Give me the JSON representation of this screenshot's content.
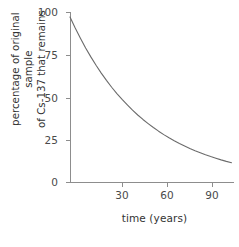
{
  "chart_data": {
    "type": "line",
    "title": "",
    "subtitle": "",
    "xlabel": "time (years)",
    "ylabel_line1": "percentage of original sample",
    "ylabel_line2": "of Cs-137 that remains",
    "ylabel": "percentage of original sample of Cs-137 that remains",
    "xlim": [
      0,
      95
    ],
    "ylim": [
      0,
      103
    ],
    "xticks": [
      30,
      60,
      90
    ],
    "xtick_labels": [
      "30",
      "60",
      "90"
    ],
    "yticks": [
      0,
      25,
      50,
      75,
      100
    ],
    "ytick_labels": [
      "0",
      "25",
      "50",
      "75",
      "100"
    ],
    "grid": false,
    "legend": "none",
    "series": [
      {
        "name": "Cs-137 remaining",
        "color": "#6b6b6b",
        "half_life_years": 30,
        "x": [
          0,
          3,
          6,
          9,
          12,
          15,
          18,
          21,
          24,
          27,
          30,
          33,
          36,
          39,
          42,
          45,
          48,
          51,
          54,
          57,
          60,
          63,
          66,
          69,
          72,
          75,
          78,
          81,
          84,
          87,
          90,
          93
        ],
        "values": [
          100,
          93.3,
          87.1,
          81.2,
          75.8,
          70.7,
          66.0,
          61.6,
          57.4,
          53.6,
          50.0,
          46.7,
          43.5,
          40.6,
          37.9,
          35.4,
          33.0,
          30.8,
          28.7,
          26.8,
          25.0,
          23.3,
          21.8,
          20.3,
          18.9,
          17.7,
          16.5,
          15.4,
          14.4,
          13.4,
          12.5,
          11.7
        ]
      }
    ],
    "annotations": [],
    "colors": {
      "curve": "#6b6b6b",
      "axis": "#8d8d8d",
      "tick_label": "#4a4a4a",
      "axis_title": "#333333",
      "background": "#ffffff"
    }
  }
}
